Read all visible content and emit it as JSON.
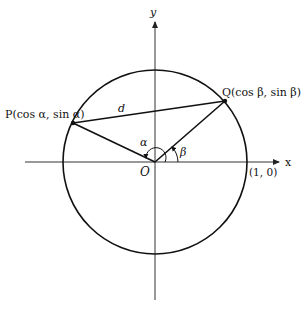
{
  "figure": {
    "type": "unit-circle-distance-diagram",
    "axes": {
      "x_label": "x",
      "y_label": "y",
      "origin_label": "O"
    },
    "points": {
      "P": {
        "label": "P(cos α, sin α)"
      },
      "Q": {
        "label": "Q(cos β, sin β)"
      },
      "unit_point": {
        "label": "(1, 0)"
      }
    },
    "segments": {
      "chord_label": "d"
    },
    "angles": {
      "alpha_label": "α",
      "beta_label": "β"
    },
    "colors": {
      "stroke": "#111111",
      "axis": "#333333",
      "background": "#ffffff"
    }
  }
}
